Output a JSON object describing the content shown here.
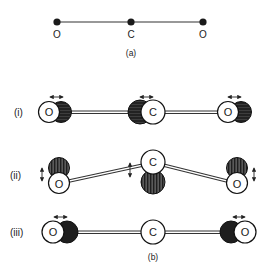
{
  "figure": {
    "part_a": {
      "label": "(a)",
      "atoms": [
        {
          "symbol": "O",
          "x": 57
        },
        {
          "symbol": "C",
          "x": 131
        },
        {
          "symbol": "O",
          "x": 203
        }
      ]
    },
    "part_b": {
      "label": "(b)",
      "modes": [
        {
          "label": "(i)",
          "description": "symmetric stretch",
          "atoms": [
            {
              "symbol": "O",
              "displacement": "horizontal"
            },
            {
              "symbol": "C",
              "displacement": "horizontal"
            },
            {
              "symbol": "O",
              "displacement": "horizontal"
            }
          ]
        },
        {
          "label": "(ii)",
          "description": "bending",
          "atoms": [
            {
              "symbol": "O",
              "displacement": "vertical"
            },
            {
              "symbol": "C",
              "displacement": "vertical"
            },
            {
              "symbol": "O",
              "displacement": "vertical"
            }
          ]
        },
        {
          "label": "(iii)",
          "description": "asymmetric stretch",
          "atoms": [
            {
              "symbol": "O",
              "displacement": "horizontal"
            },
            {
              "symbol": "C",
              "displacement": "none"
            },
            {
              "symbol": "O",
              "displacement": "horizontal"
            }
          ]
        }
      ]
    },
    "colors": {
      "ink": "#1a1a1a",
      "dark_fill": "#262626",
      "stripe_fill": "#3a3a3a",
      "background": "#ffffff"
    }
  }
}
